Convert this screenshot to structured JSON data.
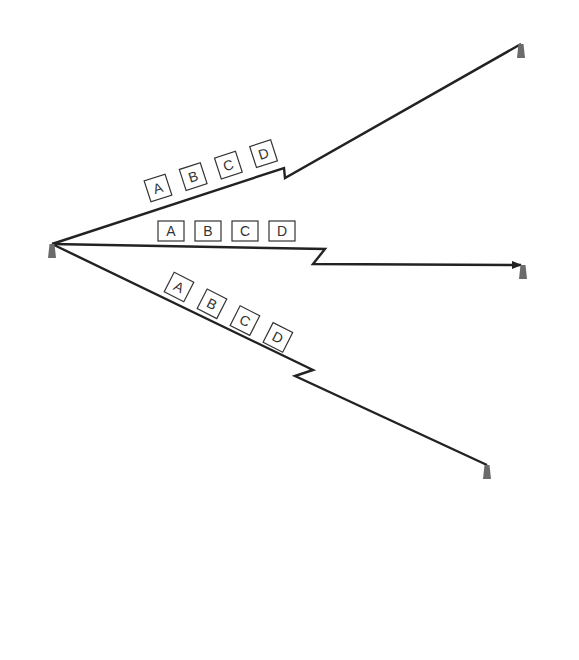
{
  "diagram": {
    "type": "network-broadcast",
    "colors": {
      "tower": "#6b6b6b",
      "link": "#222222",
      "packet_border": "#333333",
      "background": "#ffffff"
    },
    "towers": [
      {
        "id": "source",
        "role": "transmitter",
        "tip": [
          52,
          244
        ]
      },
      {
        "id": "receiver-top",
        "role": "receiver",
        "tip": [
          521,
          44
        ]
      },
      {
        "id": "receiver-middle",
        "role": "receiver",
        "tip": [
          523,
          265
        ]
      },
      {
        "id": "receiver-bottom",
        "role": "receiver",
        "tip": [
          487,
          465
        ]
      }
    ],
    "links": [
      {
        "to": "receiver-top",
        "packets": [
          "A",
          "B",
          "C",
          "D"
        ],
        "arrow": false
      },
      {
        "to": "receiver-middle",
        "packets": [
          "A",
          "B",
          "C",
          "D"
        ],
        "arrow": true
      },
      {
        "to": "receiver-bottom",
        "packets": [
          "A",
          "B",
          "C",
          "D"
        ],
        "arrow": false
      }
    ]
  }
}
